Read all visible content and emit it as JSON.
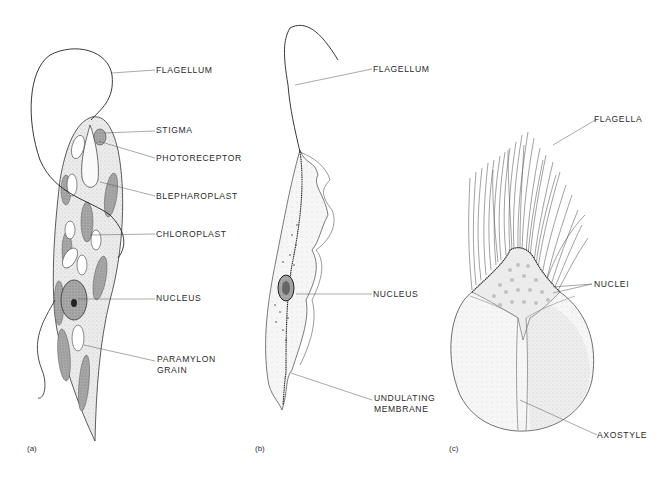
{
  "figure": {
    "panels": [
      {
        "id": "a",
        "panel_label": "(a)",
        "labels": [
          "FLAGELLUM",
          "STIGMA",
          "PHOTORECEPTOR",
          "BLEPHAROPLAST",
          "CHLOROPLAST",
          "NUCLEUS",
          "PARAMYLON",
          "GRAIN"
        ]
      },
      {
        "id": "b",
        "panel_label": "(b)",
        "labels": [
          "FLAGELLUM",
          "NUCLEUS",
          "UNDULATING",
          "MEMBRANE"
        ]
      },
      {
        "id": "c",
        "panel_label": "(c)",
        "labels": [
          "FLAGELLA",
          "NUCLEI",
          "AXOSTYLE"
        ]
      }
    ],
    "colors": {
      "ink": "#2a2a2a",
      "cell_fill": "#e4e4e4",
      "chloroplast_fill": "#9a9a9a",
      "nucleus_fill": "#6e6e6e",
      "nuclei_dots": "#c8c8c8"
    }
  }
}
